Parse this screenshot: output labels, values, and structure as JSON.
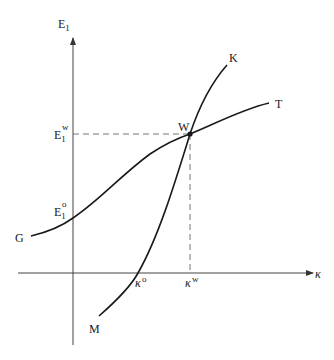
{
  "diagram": {
    "axes": {
      "y_label": "E",
      "y_label_sub": "1",
      "x_label": "κ"
    },
    "curves": {
      "gt": {
        "start_label": "G",
        "end_label": "T"
      },
      "mk": {
        "start_label": "M",
        "end_label": "K"
      }
    },
    "intersection": {
      "label": "W"
    },
    "y_ticks": {
      "e1w": {
        "base": "E",
        "sub": "1",
        "sup": "w"
      },
      "e1o": {
        "base": "E",
        "sub": "1",
        "sup": "o"
      }
    },
    "x_ticks": {
      "kappa_o": {
        "base": "κ",
        "sup": "o"
      },
      "kappa_w": {
        "base": "κ",
        "sup": "w"
      }
    },
    "colors": {
      "line": "#1a1a1a",
      "axis": "#555555",
      "dash": "#777777"
    }
  }
}
